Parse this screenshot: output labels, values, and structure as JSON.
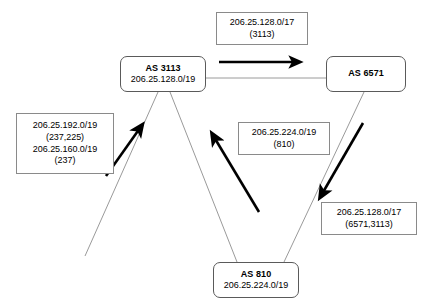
{
  "diagram": {
    "nodes": [
      {
        "id": "as3113",
        "title": "AS 3113",
        "prefix": "206.25.128.0/19"
      },
      {
        "id": "as6571",
        "title": "AS 6571",
        "prefix": ""
      },
      {
        "id": "as810",
        "title": "AS 810",
        "prefix": "206.25.224.0/19"
      }
    ],
    "annotations": [
      {
        "id": "top",
        "lines": [
          "206.25.128.0/17",
          "(3113)"
        ]
      },
      {
        "id": "left",
        "lines": [
          "206.25.192.0/19",
          "(237,225)",
          "206.25.160.0/19",
          "(237)"
        ]
      },
      {
        "id": "middle",
        "lines": [
          "206.25.224.0/19",
          "(810)"
        ]
      },
      {
        "id": "right",
        "lines": [
          "206.25.128.0/17",
          "(6571,3113)"
        ]
      }
    ],
    "colors": {
      "link_line": "#9a9a9a",
      "arrow": "#000000",
      "node_border": "#5a5a5a",
      "annotation_border": "#8a8a8a",
      "background": "#ffffff",
      "text": "#000000"
    }
  }
}
